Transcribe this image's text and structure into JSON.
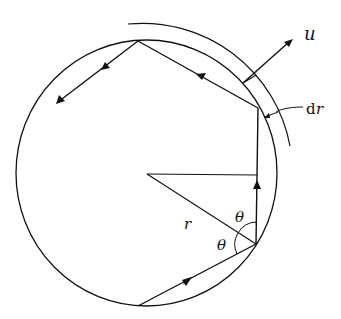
{
  "figure": {
    "labels": {
      "velocity": "u",
      "thickness_d": "d",
      "thickness_r": "r",
      "radius": "r",
      "angle_upper": "θ",
      "angle_lower": "θ"
    },
    "colors": {
      "stroke": "#111111",
      "background": "#ffffff"
    }
  }
}
